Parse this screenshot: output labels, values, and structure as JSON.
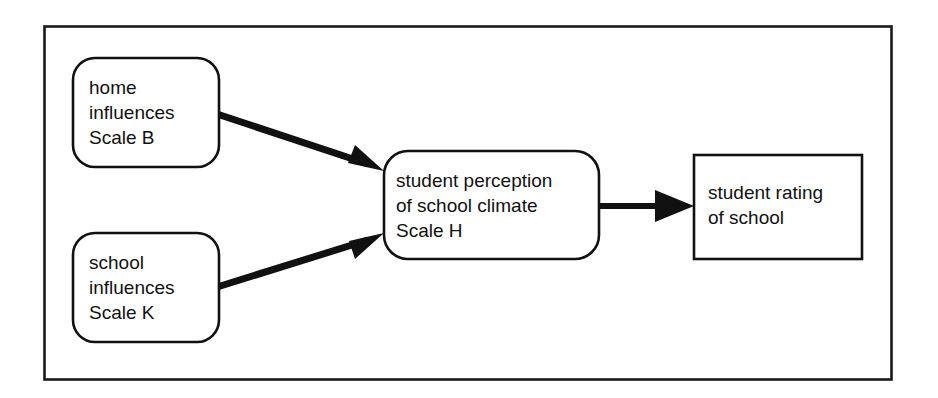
{
  "diagram": {
    "frame": {
      "label": "outer-frame"
    },
    "colors": {
      "stroke": "#111111",
      "frame_stroke": "#1a1a1a",
      "fill": "#ffffff",
      "text": "#111111"
    },
    "nodes": [
      {
        "id": "home-influences",
        "shape": "rounded-rectangle",
        "lines": [
          "home",
          "influences",
          "Scale B"
        ]
      },
      {
        "id": "school-influences",
        "shape": "rounded-rectangle",
        "lines": [
          "school",
          "influences",
          "Scale K"
        ]
      },
      {
        "id": "student-perception",
        "shape": "rounded-rectangle",
        "lines": [
          "student perception",
          "of school climate",
          "Scale H"
        ]
      },
      {
        "id": "student-rating",
        "shape": "rectangle",
        "lines": [
          "student rating",
          "of school"
        ]
      }
    ],
    "edges": [
      {
        "id": "home-to-perception",
        "from": "home-influences",
        "to": "student-perception",
        "style": "solid-thick-arrow"
      },
      {
        "id": "school-to-perception",
        "from": "school-influences",
        "to": "student-perception",
        "style": "solid-thick-arrow"
      },
      {
        "id": "perception-to-rating",
        "from": "student-perception",
        "to": "student-rating",
        "style": "solid-thick-arrow"
      }
    ]
  }
}
